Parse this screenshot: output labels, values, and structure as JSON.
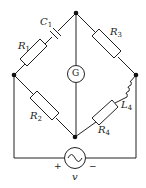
{
  "diagram": {
    "type": "circuit",
    "components": [
      {
        "id": "C1",
        "label": "C",
        "sub": "1",
        "kind": "capacitor"
      },
      {
        "id": "R1",
        "label": "R",
        "sub": "1",
        "kind": "resistor"
      },
      {
        "id": "R2",
        "label": "R",
        "sub": "2",
        "kind": "resistor"
      },
      {
        "id": "R3",
        "label": "R",
        "sub": "3",
        "kind": "resistor"
      },
      {
        "id": "R4",
        "label": "R",
        "sub": "4",
        "kind": "resistor"
      },
      {
        "id": "L4",
        "label": "L",
        "sub": "4",
        "kind": "inductor"
      },
      {
        "id": "G",
        "label": "G",
        "kind": "galvanometer"
      },
      {
        "id": "v",
        "label": "v",
        "kind": "ac-source"
      }
    ],
    "source_plus": "+",
    "source_minus": "−",
    "colors": {
      "line": "#222222",
      "fill": "#ffffff"
    }
  }
}
